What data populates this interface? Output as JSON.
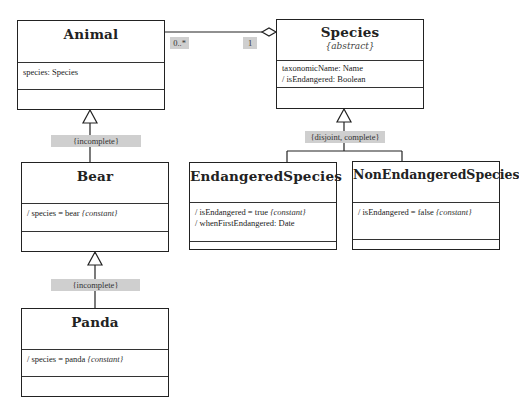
{
  "diagram": {
    "classes": {
      "animal": {
        "name": "Animal",
        "attributes": [
          "species: Species"
        ]
      },
      "species": {
        "name": "Species",
        "stereotype": "{abstract}",
        "attributes": [
          "taxonomicName: Name",
          "/  isEndangered: Boolean"
        ]
      },
      "bear": {
        "name": "Bear",
        "attributes": [
          {
            "text": "/  species = bear ",
            "constraint": "{constant}"
          }
        ]
      },
      "panda": {
        "name": "Panda",
        "attributes": [
          {
            "text": "/  species = panda ",
            "constraint": "{constant}"
          }
        ]
      },
      "endangered": {
        "name": "EndangeredSpecies",
        "attributes": [
          {
            "text": "/  isEndangered = true ",
            "constraint": "{constant}"
          },
          {
            "text": "/  whenFirstEndangered: Date",
            "constraint": ""
          }
        ]
      },
      "nonendangered": {
        "name": "NonEndangeredSpecies",
        "attributes": [
          {
            "text": "/  isEndangered = false ",
            "constraint": "{constant}"
          }
        ]
      }
    },
    "association": {
      "animal_multiplicity": "0..*",
      "species_multiplicity": "1"
    },
    "generalization_sets": {
      "animal_bear": "{incomplete}",
      "bear_panda": "{incomplete}",
      "species_subtypes": "{disjoint,  complete}"
    },
    "colors": {
      "line": "#222222",
      "label_bg": "#cfcfcf",
      "background": "#ffffff"
    }
  }
}
